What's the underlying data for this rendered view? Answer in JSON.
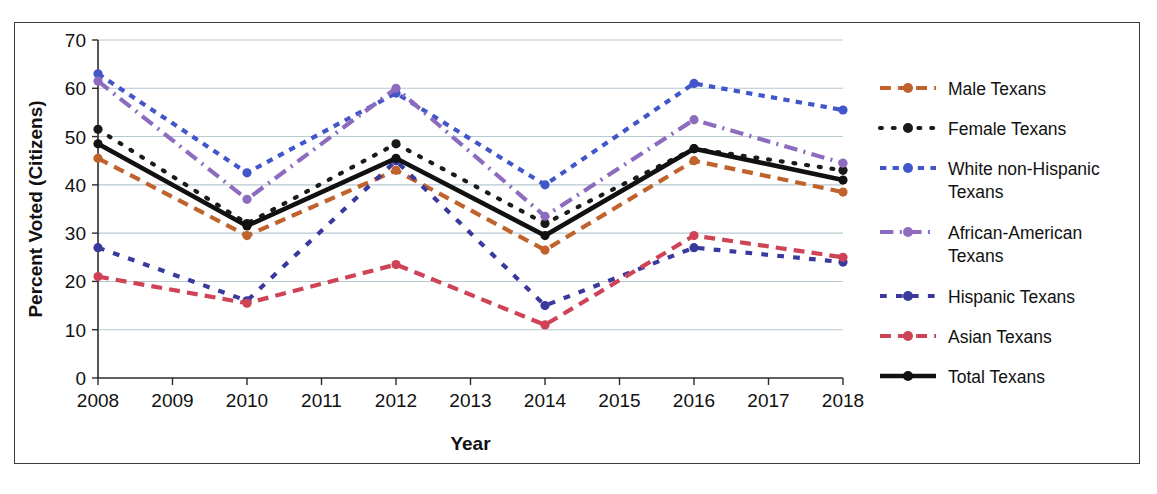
{
  "chart_data": {
    "type": "line",
    "title": "",
    "xlabel": "Year",
    "ylabel": "Percent Voted (Citizens)",
    "x": [
      2008,
      2010,
      2012,
      2014,
      2016,
      2018
    ],
    "xtick_labels": [
      "2008",
      "2009",
      "2010",
      "2011",
      "2012",
      "2013",
      "2014",
      "2015",
      "2016",
      "2017",
      "2018"
    ],
    "ytick_labels": [
      "0",
      "10",
      "20",
      "30",
      "40",
      "50",
      "60",
      "70"
    ],
    "xlim": [
      2008,
      2018
    ],
    "ylim": [
      0,
      70
    ],
    "grid": "horizontal",
    "legend_position": "right",
    "series": [
      {
        "name": "Male Texans",
        "color": "#c0622c",
        "style": "dashed",
        "values": [
          45.5,
          29.5,
          43.0,
          26.5,
          45.0,
          38.5
        ]
      },
      {
        "name": "Female Texans",
        "color": "#1a1a1a",
        "style": "dotted",
        "values": [
          51.5,
          32.0,
          48.5,
          32.0,
          47.5,
          43.0
        ]
      },
      {
        "name": "White non-Hispanic Texans",
        "color": "#4156c8",
        "style": "square-dotted",
        "values": [
          63.0,
          42.5,
          59.0,
          40.0,
          61.0,
          55.5
        ]
      },
      {
        "name": "African-American Texans",
        "color": "#8d6cc0",
        "style": "dash-dot",
        "values": [
          61.5,
          37.0,
          60.0,
          33.5,
          53.5,
          44.5
        ]
      },
      {
        "name": "Hispanic Texans",
        "color": "#3a3a9e",
        "style": "dashed-square",
        "values": [
          27.0,
          16.0,
          45.0,
          15.0,
          27.0,
          24.0
        ]
      },
      {
        "name": "Asian Texans",
        "color": "#cf4356",
        "style": "dashed",
        "values": [
          21.0,
          15.5,
          23.5,
          11.0,
          29.5,
          25.0
        ]
      },
      {
        "name": "Total Texans",
        "color": "#111111",
        "style": "solid",
        "values": [
          48.5,
          31.5,
          45.5,
          29.5,
          47.5,
          41.0
        ]
      }
    ]
  },
  "legend": {
    "items": [
      {
        "label": "Male Texans"
      },
      {
        "label": "Female Texans"
      },
      {
        "label": "White non-Hispanic",
        "label2": "Texans"
      },
      {
        "label": "African-American",
        "label2": "Texans"
      },
      {
        "label": "Hispanic Texans"
      },
      {
        "label": "Asian Texans"
      },
      {
        "label": "Total Texans"
      }
    ]
  }
}
